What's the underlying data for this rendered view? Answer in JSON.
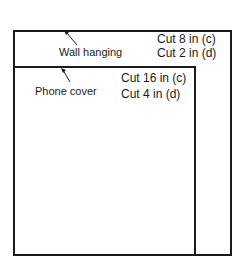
{
  "diagram": {
    "wall_hanging": {
      "label": "Wall hanging",
      "cut_c": "Cut 8 in (c)",
      "cut_d": "Cut 2 in (d)"
    },
    "phone_cover": {
      "label": "Phone cover",
      "cut_c": "Cut 16 in (c)",
      "cut_d": "Cut 4 in (d)"
    },
    "line_color": "#1a1a1a",
    "background": "#ffffff"
  }
}
